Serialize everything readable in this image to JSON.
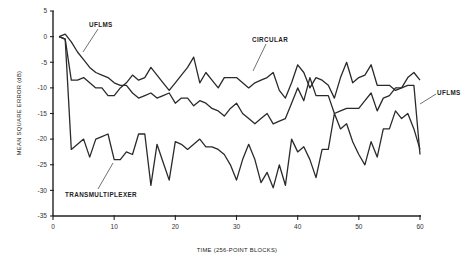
{
  "chart_data": {
    "type": "line",
    "title": "",
    "xlabel": "TIME (256-POINT BLOCKS)",
    "ylabel": "MEAN SQUARE ERROR (dB)",
    "xlim": [
      0,
      60
    ],
    "ylim": [
      -35,
      5
    ],
    "xticks": [
      0,
      10,
      20,
      30,
      40,
      50,
      60
    ],
    "yticks": [
      5,
      0,
      -5,
      -10,
      -15,
      -20,
      -25,
      -30,
      -35
    ],
    "grid": false,
    "legend": "none (inline annotations)",
    "annotations": [
      {
        "text": "UFLMS",
        "target_series": "UFLMS",
        "position": "upper-left"
      },
      {
        "text": "CIRCULAR",
        "target_series": "CIRCULAR",
        "position": "upper-middle"
      },
      {
        "text": "UFLMS",
        "target_series": "UFLMS",
        "position": "right"
      },
      {
        "text": "TRANSMULTIPLEXER",
        "target_series": "TRANSMULTIPLEXER",
        "position": "lower-left"
      }
    ],
    "series": [
      {
        "name": "CIRCULAR",
        "x": [
          1,
          2,
          3,
          4,
          5,
          6,
          7,
          8,
          9,
          10,
          11,
          12,
          13,
          14,
          15,
          16,
          17,
          18,
          19,
          20,
          21,
          22,
          23,
          24,
          25,
          26,
          27,
          28,
          29,
          30,
          31,
          32,
          33,
          34,
          35,
          36,
          37,
          38,
          39,
          40,
          41,
          42,
          43,
          44,
          45,
          46,
          47,
          48,
          49,
          50,
          51,
          52,
          53,
          54,
          55,
          56,
          57,
          58,
          59,
          60
        ],
        "values": [
          0,
          -0.5,
          -8.5,
          -8.5,
          -8,
          -9,
          -10,
          -10,
          -11.5,
          -11.5,
          -10,
          -9,
          -7.5,
          -8.5,
          -8,
          -6,
          -7.5,
          -9,
          -10.5,
          -9,
          -7.5,
          -6,
          -4,
          -9,
          -7,
          -8.5,
          -10,
          -8,
          -8,
          -8,
          -9,
          -10,
          -9,
          -8.5,
          -8,
          -7,
          -10.5,
          -12,
          -9,
          -5.5,
          -7,
          -10,
          -8,
          -8.5,
          -9.5,
          -12,
          -8,
          -5,
          -9,
          -8,
          -7.5,
          -5.5,
          -9.5,
          -9.5,
          -9.5,
          -10.5,
          -10,
          -8,
          -7,
          -8.5
        ]
      },
      {
        "name": "UFLMS",
        "x": [
          1,
          2,
          3,
          4,
          5,
          6,
          7,
          8,
          9,
          10,
          11,
          12,
          13,
          14,
          15,
          16,
          17,
          18,
          19,
          20,
          21,
          22,
          23,
          24,
          25,
          26,
          27,
          28,
          29,
          30,
          31,
          32,
          33,
          34,
          35,
          36,
          37,
          38,
          39,
          40,
          41,
          42,
          43,
          44,
          45,
          46,
          47,
          48,
          49,
          50,
          51,
          52,
          53,
          54,
          55,
          56,
          57,
          58,
          59,
          60
        ],
        "values": [
          0,
          0.5,
          -1,
          -3,
          -4.5,
          -6,
          -7,
          -7.5,
          -8,
          -9,
          -9.5,
          -9.5,
          -11,
          -12,
          -11.5,
          -11,
          -12,
          -11.5,
          -11,
          -13,
          -12,
          -12,
          -13.5,
          -12.5,
          -13,
          -14,
          -14.5,
          -15.5,
          -14,
          -13,
          -15,
          -16,
          -17,
          -16,
          -15,
          -17,
          -16.5,
          -16,
          -13,
          -10,
          -12.5,
          -8,
          -11.5,
          -11.5,
          -11.5,
          -15,
          -14.5,
          -14,
          -14,
          -14,
          -12.5,
          -11,
          -14.5,
          -12,
          -11.5,
          -10,
          -10,
          -9.5,
          -9.5,
          -23
        ]
      },
      {
        "name": "TRANSMULTIPLEXER",
        "x": [
          1,
          2,
          3,
          4,
          5,
          6,
          7,
          8,
          9,
          10,
          11,
          12,
          13,
          14,
          15,
          16,
          17,
          18,
          19,
          20,
          21,
          22,
          23,
          24,
          25,
          26,
          27,
          28,
          29,
          30,
          31,
          32,
          33,
          34,
          35,
          36,
          37,
          38,
          39,
          40,
          41,
          42,
          43,
          44,
          45,
          46,
          47,
          48,
          49,
          50,
          51,
          52,
          53,
          54,
          55,
          56,
          57,
          58,
          59,
          60
        ],
        "values": [
          0,
          -0.5,
          -22,
          -21,
          -20,
          -23.5,
          -20,
          -19.5,
          -19,
          -24,
          -24,
          -22.5,
          -23,
          -19,
          -19,
          -29,
          -21,
          -24.5,
          -28,
          -20.5,
          -21,
          -22,
          -21,
          -20,
          -21.5,
          -21.5,
          -22,
          -23,
          -25,
          -28,
          -24,
          -21,
          -24,
          -28.5,
          -26.5,
          -29.5,
          -25,
          -29,
          -20,
          -22.5,
          -21.5,
          -24,
          -27.5,
          -22,
          -22,
          -15,
          -18,
          -17,
          -20.5,
          -23,
          -25,
          -20.5,
          -23.5,
          -18,
          -18,
          -14.5,
          -16,
          -15,
          -18,
          -22
        ]
      }
    ]
  }
}
